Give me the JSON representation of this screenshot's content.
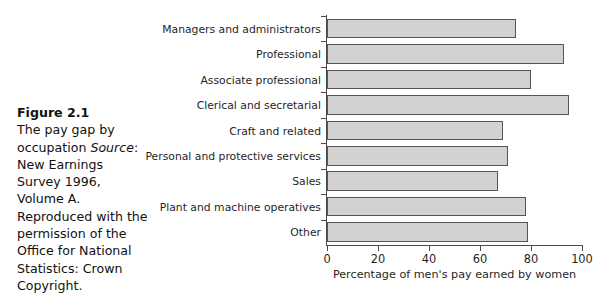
{
  "caption": {
    "figure_number": "Figure 2.1",
    "title": "The pay gap by occupation",
    "source_label": "Source",
    "source_text": ": New Earnings Survey 1996, Volume A. Reproduced with the permission of the Office for National Statistics: Crown Copyright."
  },
  "chart_data": {
    "type": "bar",
    "orientation": "horizontal",
    "title": "",
    "xlabel": "Percentage of men's pay earned by women",
    "ylabel": "",
    "xlim": [
      0,
      100
    ],
    "xticks": [
      0,
      20,
      40,
      60,
      80,
      100
    ],
    "xtick_labels": [
      "0",
      "20",
      "40",
      "60",
      "80",
      "100"
    ],
    "grid": false,
    "legend": false,
    "bar_fill_color": "#d2d2d2",
    "bar_edge_color": "#555555",
    "axis_color": "#4a4a4a",
    "background_color": "#ffffff",
    "categories": [
      "Managers and administrators",
      "Professional",
      "Associate professional",
      "Clerical and secretarial",
      "Craft and related",
      "Personal and protective services",
      "Sales",
      "Plant and machine operatives",
      "Other"
    ],
    "values": [
      74,
      93,
      80,
      95,
      69,
      71,
      67,
      78,
      79
    ]
  }
}
